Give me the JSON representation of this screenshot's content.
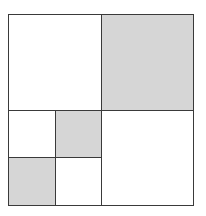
{
  "diagram": {
    "colors": {
      "shaded": "#d6d6d6",
      "unshaded": "#ffffff",
      "line": "#3a3a3a"
    },
    "cells": [
      {
        "id": "top-left",
        "x": 8,
        "y": 14,
        "w": 94,
        "h": 97,
        "shaded": false
      },
      {
        "id": "top-right",
        "x": 101,
        "y": 14,
        "w": 93,
        "h": 97,
        "shaded": true
      },
      {
        "id": "bottom-right",
        "x": 101,
        "y": 110,
        "w": 93,
        "h": 96,
        "shaded": false
      },
      {
        "id": "lower-left-top-left",
        "x": 8,
        "y": 110,
        "w": 48,
        "h": 48,
        "shaded": false
      },
      {
        "id": "lower-left-top-right",
        "x": 55,
        "y": 110,
        "w": 47,
        "h": 48,
        "shaded": true
      },
      {
        "id": "lower-left-bottom-left",
        "x": 8,
        "y": 157,
        "w": 48,
        "h": 49,
        "shaded": true
      },
      {
        "id": "lower-left-bottom-right",
        "x": 55,
        "y": 157,
        "w": 47,
        "h": 49,
        "shaded": false
      }
    ]
  }
}
